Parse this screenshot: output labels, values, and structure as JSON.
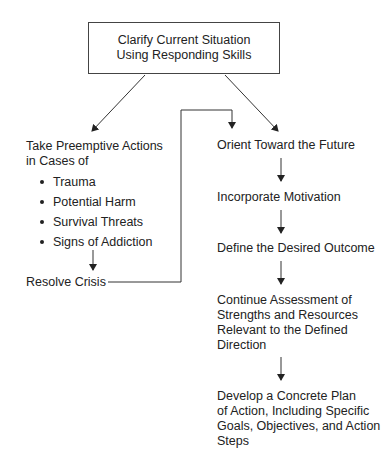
{
  "top_box": {
    "line1": "Clarify Current Situation",
    "line2": "Using Responding Skills"
  },
  "left_branch": {
    "heading_line1": "Take Preemptive Actions",
    "heading_line2": "in Cases of",
    "bullets": [
      "Trauma",
      "Potential Harm",
      "Survival Threats",
      "Signs of Addiction"
    ],
    "resolve": "Resolve Crisis"
  },
  "right_branch": {
    "steps": [
      {
        "lines": [
          "Orient Toward the Future"
        ]
      },
      {
        "lines": [
          "Incorporate Motivation"
        ]
      },
      {
        "lines": [
          "Define the Desired Outcome"
        ]
      },
      {
        "lines": [
          "Continue Assessment of",
          "Strengths and Resources",
          "Relevant to the Defined",
          "Direction"
        ]
      },
      {
        "lines": [
          "Develop a Concrete Plan",
          "of Action, Including Specific",
          "Goals, Objectives, and Action",
          "Steps"
        ]
      }
    ]
  }
}
